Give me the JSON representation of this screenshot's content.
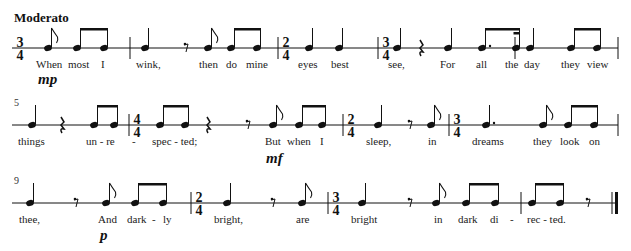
{
  "score": {
    "tempo": "Moderato",
    "systems": [
      {
        "staff_y": 48,
        "measure_number": null,
        "start_x": 12,
        "end_x": 618,
        "barlines": [
          130,
          278,
          378,
          515,
          618
        ],
        "time_signatures": [
          {
            "x": 20,
            "top": "3",
            "bottom": "4"
          },
          {
            "x": 286,
            "top": "2",
            "bottom": "4"
          },
          {
            "x": 386,
            "top": "3",
            "bottom": "4"
          }
        ],
        "notes": [
          {
            "x": 48,
            "type": "eighth-flag"
          },
          {
            "x": 77,
            "type": "eighth-beam-start",
            "beam_to": 104
          },
          {
            "x": 104,
            "type": "eighth-beam-end"
          },
          {
            "x": 145,
            "type": "quarter"
          },
          {
            "x": 208,
            "type": "eighth-flag"
          },
          {
            "x": 231,
            "type": "eighth-beam-start",
            "beam_to": 257
          },
          {
            "x": 257,
            "type": "eighth-beam-end"
          },
          {
            "x": 309,
            "type": "quarter"
          },
          {
            "x": 339,
            "type": "quarter"
          },
          {
            "x": 397,
            "type": "quarter"
          },
          {
            "x": 448,
            "type": "quarter"
          },
          {
            "x": 482,
            "type": "dotted-eighth-beam-start",
            "beam_to": 516
          },
          {
            "x": 516,
            "type": "sixteenth-beam-end"
          },
          {
            "x": 530,
            "type": "quarter"
          },
          {
            "x": 571,
            "type": "eighth-beam-start",
            "beam_to": 597
          },
          {
            "x": 597,
            "type": "eighth-beam-end"
          }
        ],
        "rests": [
          {
            "x": 186,
            "type": "eighth"
          },
          {
            "x": 421,
            "type": "quarter"
          }
        ],
        "lyrics": [
          {
            "x": 36,
            "text": "When"
          },
          {
            "x": 68,
            "text": "most"
          },
          {
            "x": 101,
            "text": "I"
          },
          {
            "x": 136,
            "text": "wink,"
          },
          {
            "x": 199,
            "text": "then"
          },
          {
            "x": 226,
            "text": "do"
          },
          {
            "x": 246,
            "text": "mine"
          },
          {
            "x": 298,
            "text": "eyes"
          },
          {
            "x": 331,
            "text": "best"
          },
          {
            "x": 388,
            "text": "see,"
          },
          {
            "x": 440,
            "text": "For"
          },
          {
            "x": 476,
            "text": "all"
          },
          {
            "x": 505,
            "text": "the"
          },
          {
            "x": 524,
            "text": "day"
          },
          {
            "x": 561,
            "text": "they"
          },
          {
            "x": 587,
            "text": "view"
          }
        ],
        "dynamics": [
          {
            "x": 38,
            "y": 84,
            "text": "mp"
          }
        ]
      },
      {
        "staff_y": 125,
        "measure_number": "5",
        "start_x": 12,
        "end_x": 618,
        "barlines": [
          129,
          343,
          449,
          618
        ],
        "time_signatures": [
          {
            "x": 137,
            "top": "4",
            "bottom": "4"
          },
          {
            "x": 351,
            "top": "2",
            "bottom": "4"
          },
          {
            "x": 457,
            "top": "3",
            "bottom": "4"
          }
        ],
        "notes": [
          {
            "x": 32,
            "type": "quarter"
          },
          {
            "x": 94,
            "type": "eighth-beam-start",
            "beam_to": 114
          },
          {
            "x": 114,
            "type": "eighth-beam-end"
          },
          {
            "x": 160,
            "type": "eighth-beam-start",
            "beam_to": 185
          },
          {
            "x": 185,
            "type": "eighth-beam-end"
          },
          {
            "x": 273,
            "type": "eighth-flag"
          },
          {
            "x": 299,
            "type": "eighth-beam-start",
            "beam_to": 322
          },
          {
            "x": 322,
            "type": "eighth-beam-end"
          },
          {
            "x": 378,
            "type": "quarter"
          },
          {
            "x": 431,
            "type": "eighth-flag"
          },
          {
            "x": 486,
            "type": "dotted-quarter"
          },
          {
            "x": 543,
            "type": "eighth-flag"
          },
          {
            "x": 568,
            "type": "eighth-beam-start",
            "beam_to": 594
          },
          {
            "x": 594,
            "type": "eighth-beam-end"
          }
        ],
        "rests": [
          {
            "x": 62,
            "type": "quarter"
          },
          {
            "x": 208,
            "type": "quarter"
          },
          {
            "x": 248,
            "type": "eighth"
          },
          {
            "x": 410,
            "type": "eighth"
          }
        ],
        "lyrics": [
          {
            "x": 18,
            "text": "things"
          },
          {
            "x": 86,
            "text": "un - re"
          },
          {
            "x": 132,
            "text": "-"
          },
          {
            "x": 152,
            "text": "spec - ted;"
          },
          {
            "x": 265,
            "text": "But"
          },
          {
            "x": 287,
            "text": "when"
          },
          {
            "x": 320,
            "text": "I"
          },
          {
            "x": 366,
            "text": "sleep,"
          },
          {
            "x": 428,
            "text": "in"
          },
          {
            "x": 472,
            "text": "dreams"
          },
          {
            "x": 533,
            "text": "they"
          },
          {
            "x": 560,
            "text": "look"
          },
          {
            "x": 589,
            "text": "on"
          }
        ],
        "dynamics": [
          {
            "x": 266,
            "y": 163,
            "text": "mf"
          }
        ]
      },
      {
        "staff_y": 203,
        "measure_number": "9",
        "start_x": 12,
        "end_x": 617,
        "barlines": [
          191,
          328,
          521
        ],
        "final_barline_x": 612,
        "time_signatures": [
          {
            "x": 199,
            "top": "2",
            "bottom": "4"
          },
          {
            "x": 336,
            "top": "3",
            "bottom": "4"
          }
        ],
        "notes": [
          {
            "x": 30,
            "type": "quarter"
          },
          {
            "x": 106,
            "type": "eighth-flag"
          },
          {
            "x": 135,
            "type": "eighth-beam-start",
            "beam_to": 163
          },
          {
            "x": 163,
            "type": "eighth-beam-end"
          },
          {
            "x": 227,
            "type": "quarter"
          },
          {
            "x": 302,
            "type": "eighth-flag"
          },
          {
            "x": 362,
            "type": "quarter"
          },
          {
            "x": 436,
            "type": "eighth-flag"
          },
          {
            "x": 466,
            "type": "eighth-beam-start",
            "beam_to": 495
          },
          {
            "x": 495,
            "type": "eighth-beam-end"
          },
          {
            "x": 532,
            "type": "eighth-beam-start",
            "beam_to": 560
          },
          {
            "x": 560,
            "type": "eighth-beam-end"
          }
        ],
        "rests": [
          {
            "x": 76,
            "type": "eighth"
          },
          {
            "x": 273,
            "type": "eighth"
          },
          {
            "x": 410,
            "type": "eighth"
          },
          {
            "x": 588,
            "type": "eighth"
          }
        ],
        "lyrics": [
          {
            "x": 19,
            "text": "thee,"
          },
          {
            "x": 98,
            "text": "And"
          },
          {
            "x": 127,
            "text": "dark"
          },
          {
            "x": 152,
            "text": "-"
          },
          {
            "x": 163,
            "text": "ly"
          },
          {
            "x": 214,
            "text": "bright,"
          },
          {
            "x": 296,
            "text": "are"
          },
          {
            "x": 351,
            "text": "bright"
          },
          {
            "x": 434,
            "text": "in"
          },
          {
            "x": 458,
            "text": "dark"
          },
          {
            "x": 490,
            "text": "di"
          },
          {
            "x": 510,
            "text": "-"
          },
          {
            "x": 527,
            "text": "rec - ted."
          }
        ],
        "dynamics": [
          {
            "x": 100,
            "y": 240,
            "text": "p"
          }
        ]
      }
    ]
  }
}
